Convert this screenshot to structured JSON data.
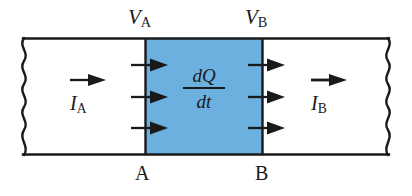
{
  "figure": {
    "type": "physics-diagram",
    "canvas": {
      "width": 412,
      "height": 196
    },
    "colors": {
      "background": "#ffffff",
      "conductor_fill": "#ffffff",
      "segment_fill": "#6cb0e0",
      "outline": "#1a1a1a",
      "text": "#1a1a1a"
    },
    "conductor": {
      "top_y": 38,
      "bottom_y": 155,
      "left_x": 20,
      "right_x": 392,
      "boundary_a_x": 145,
      "boundary_b_x": 262,
      "left_edge_style": "wavy",
      "right_edge_style": "wavy"
    },
    "labels": {
      "potential_a": {
        "symbol": "V",
        "subscript": "A"
      },
      "potential_b": {
        "symbol": "V",
        "subscript": "B"
      },
      "section_a": "A",
      "section_b": "B",
      "current_in": {
        "symbol": "I",
        "subscript": "A"
      },
      "current_out": {
        "symbol": "I",
        "subscript": "B"
      },
      "charge_rate": {
        "numerator": "dQ",
        "denominator": "dt"
      }
    },
    "arrows": {
      "current_in_arrow": {
        "x": 72,
        "y": 80,
        "length": 34,
        "direction": "right"
      },
      "current_out_arrow": {
        "x": 313,
        "y": 80,
        "length": 34,
        "direction": "right"
      },
      "flux_arrows_a_y": [
        65,
        97,
        128
      ],
      "flux_arrows_b_y": [
        65,
        97,
        128
      ]
    }
  }
}
